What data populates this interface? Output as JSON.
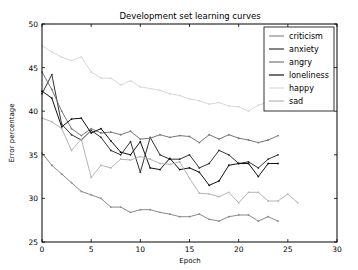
{
  "chart_data": {
    "type": "line",
    "title": "Development set learning curves",
    "xlabel": "Epoch",
    "ylabel": "Error percentage",
    "xlim": [
      0,
      30
    ],
    "ylim": [
      25,
      50
    ],
    "xticks": [
      0,
      5,
      10,
      15,
      20,
      25,
      30
    ],
    "yticks": [
      25,
      30,
      35,
      40,
      45,
      50
    ],
    "grid": false,
    "legend_position": "upper right",
    "series": [
      {
        "name": "criticism",
        "color": "#8a8a8a",
        "x": [
          0,
          1,
          2,
          3,
          4,
          5,
          6,
          7,
          8,
          9,
          10,
          11,
          12,
          13,
          14,
          15,
          16,
          17,
          18,
          19,
          20,
          21,
          22,
          23,
          24
        ],
        "values": [
          35.2,
          33.8,
          32.8,
          31.8,
          30.8,
          30.4,
          30.0,
          29.0,
          29.0,
          28.4,
          28.7,
          28.7,
          28.4,
          28.2,
          27.9,
          27.9,
          28.2,
          27.6,
          27.4,
          27.9,
          28.1,
          28.1,
          27.4,
          27.9,
          27.4
        ]
      },
      {
        "name": "anxiety",
        "color": "#333333",
        "x": [
          0,
          1,
          2,
          3,
          4,
          5,
          6,
          7,
          8,
          9,
          10,
          11,
          12,
          13,
          14,
          15,
          16,
          17,
          18,
          19,
          20,
          21,
          22,
          23,
          24
        ],
        "values": [
          42.0,
          44.2,
          38.5,
          37.3,
          36.7,
          37.8,
          37.0,
          35.5,
          35.0,
          36.5,
          33.0,
          37.0,
          35.0,
          34.5,
          34.5,
          35.0,
          33.5,
          34.0,
          35.5,
          35.0,
          34.0,
          34.2,
          33.5,
          34.5,
          35.0
        ]
      },
      {
        "name": "angry",
        "color": "#777777",
        "x": [
          0,
          1,
          2,
          3,
          4,
          5,
          6,
          7,
          8,
          9,
          10,
          11,
          12,
          13,
          14,
          15,
          16,
          17,
          18,
          19,
          20,
          21,
          22,
          23,
          24
        ],
        "values": [
          44.5,
          42.5,
          40.0,
          38.0,
          37.2,
          38.0,
          37.5,
          37.6,
          37.3,
          37.7,
          36.8,
          36.9,
          37.3,
          37.0,
          37.2,
          37.1,
          36.4,
          37.3,
          36.8,
          37.3,
          36.9,
          36.7,
          36.4,
          36.7,
          37.2
        ]
      },
      {
        "name": "loneliness",
        "color": "#111111",
        "x": [
          0,
          1,
          2,
          3,
          4,
          5,
          6,
          7,
          8,
          9,
          10,
          11,
          12,
          13,
          14,
          15,
          16,
          17,
          18,
          19,
          20,
          21,
          22,
          23,
          24
        ],
        "values": [
          42.3,
          41.5,
          38.2,
          39.1,
          39.2,
          37.5,
          38.0,
          36.6,
          35.3,
          35.0,
          36.5,
          33.5,
          33.3,
          34.6,
          33.3,
          33.5,
          33.0,
          31.5,
          32.0,
          33.8,
          34.0,
          34.0,
          32.5,
          34.0,
          34.0
        ]
      },
      {
        "name": "happy",
        "color": "#d8d8d8",
        "x": [
          0,
          1,
          2,
          3,
          4,
          5,
          6,
          7,
          8,
          9,
          10,
          11,
          12,
          13,
          14,
          15,
          16,
          17,
          18,
          19,
          20,
          21,
          22,
          23,
          24,
          25,
          26
        ],
        "values": [
          47.5,
          46.8,
          46.2,
          45.8,
          46.2,
          44.5,
          43.8,
          43.8,
          43.0,
          43.5,
          42.8,
          42.6,
          42.4,
          42.0,
          41.8,
          41.4,
          41.2,
          40.8,
          41.0,
          40.6,
          40.5,
          40.0,
          40.7,
          41.0,
          40.3,
          40.8,
          41.5
        ]
      },
      {
        "name": "sad",
        "color": "#b5b5b5",
        "x": [
          0,
          1,
          2,
          3,
          4,
          5,
          6,
          7,
          8,
          9,
          10,
          11,
          12,
          13,
          14,
          15,
          16,
          17,
          18,
          19,
          20,
          21,
          22,
          23,
          24,
          25,
          26
        ],
        "values": [
          39.2,
          38.8,
          38.0,
          35.5,
          36.8,
          32.4,
          33.8,
          33.5,
          34.5,
          34.4,
          34.8,
          34.5,
          34.0,
          33.9,
          34.2,
          32.3,
          30.6,
          30.5,
          30.2,
          30.7,
          29.5,
          30.7,
          30.7,
          29.7,
          29.7,
          30.5,
          29.5
        ]
      }
    ]
  }
}
